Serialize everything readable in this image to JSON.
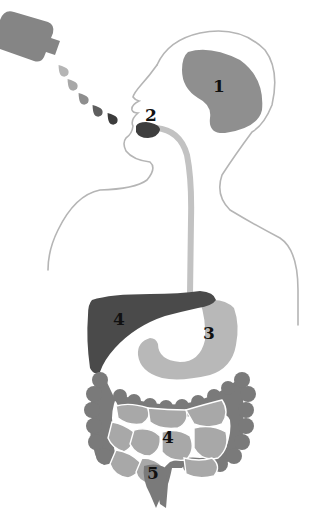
{
  "diagram": {
    "colors": {
      "outline": "#b5b5b5",
      "brain": "#8f8f8f",
      "mouth": "#3e3e3e",
      "esophagus": "#c2c2c2",
      "liver": "#4a4a4a",
      "stomach": "#b8b8b8",
      "large_intestine": "#7a7a7a",
      "small_intestine": "#a8a8a8",
      "bottle": "#858585"
    },
    "drops": [
      {
        "color": "#b5b5b5"
      },
      {
        "color": "#a8a8a8"
      },
      {
        "color": "#8e8e8e"
      },
      {
        "color": "#5e5e5e"
      },
      {
        "color": "#3c3c3c"
      }
    ],
    "labels": {
      "brain": "1",
      "mouth": "2",
      "stomach": "3",
      "liver": "4",
      "small_intestine": "4",
      "rectum": "5"
    }
  }
}
